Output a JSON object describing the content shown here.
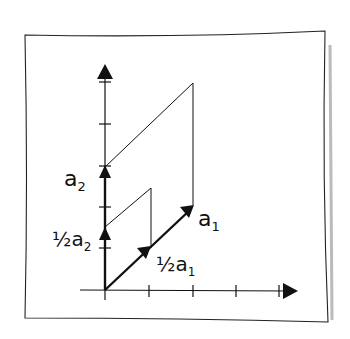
{
  "diagram": {
    "labels": {
      "a1": "a",
      "a1_sub": "1",
      "a2": "a",
      "a2_sub": "2",
      "half_a1_frac": "½",
      "half_a1": "a",
      "half_a1_sub": "1",
      "half_a2_frac": "½",
      "half_a2": "a",
      "half_a2_sub": "2"
    },
    "colors": {
      "ink": "#111111",
      "paper": "#ffffff"
    }
  }
}
